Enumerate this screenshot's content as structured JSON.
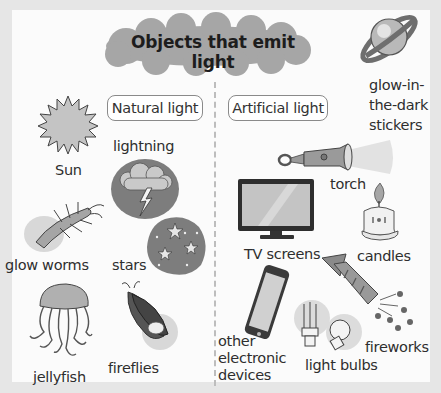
{
  "title": "Objects that emit light",
  "categories": {
    "natural": {
      "label": "Natural light"
    },
    "artificial": {
      "label": "Artificial light"
    }
  },
  "natural_items": [
    {
      "label": "Sun",
      "icon": "sun-icon"
    },
    {
      "label": "lightning",
      "icon": "lightning-icon"
    },
    {
      "label": "glow worms",
      "icon": "glow-worm-icon"
    },
    {
      "label": "stars",
      "icon": "stars-icon"
    },
    {
      "label": "jellyfish",
      "icon": "jellyfish-icon"
    },
    {
      "label": "fireflies",
      "icon": "firefly-icon"
    }
  ],
  "artificial_items": [
    {
      "label": "torch",
      "icon": "torch-icon"
    },
    {
      "label": "TV screens",
      "icon": "tv-icon"
    },
    {
      "label": "candles",
      "icon": "candle-icon"
    },
    {
      "label": "other electronic devices",
      "lines": [
        "other",
        "electronic",
        "devices"
      ],
      "icon": "phone-icon"
    },
    {
      "label": "light bulbs",
      "icon": "light-bulb-icon"
    },
    {
      "label": "fireworks",
      "icon": "firework-icon"
    }
  ],
  "extra_item": {
    "label": "glow-in-the-dark stickers",
    "lines": [
      "glow-in-",
      "the-dark",
      "stickers"
    ],
    "icon": "planet-sticker-icon"
  },
  "colors": {
    "background": "#e6e6e6",
    "panel": "#fbfbfb",
    "cloud": "#a6a6a6",
    "divider": "#bdbdbd"
  }
}
